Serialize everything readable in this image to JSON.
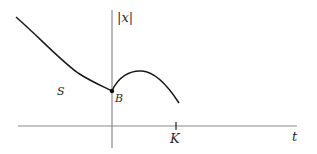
{
  "diagram": {
    "axes": {
      "vertical_label": "|x|",
      "horizontal_label": "t"
    },
    "points": {
      "origin_point_label": "B",
      "tick_label": "K"
    },
    "regions": {
      "left_region_label": "S"
    },
    "colors": {
      "curve": "#1a1a1a",
      "axis": "#888888",
      "text": "#2a2a2a"
    }
  }
}
